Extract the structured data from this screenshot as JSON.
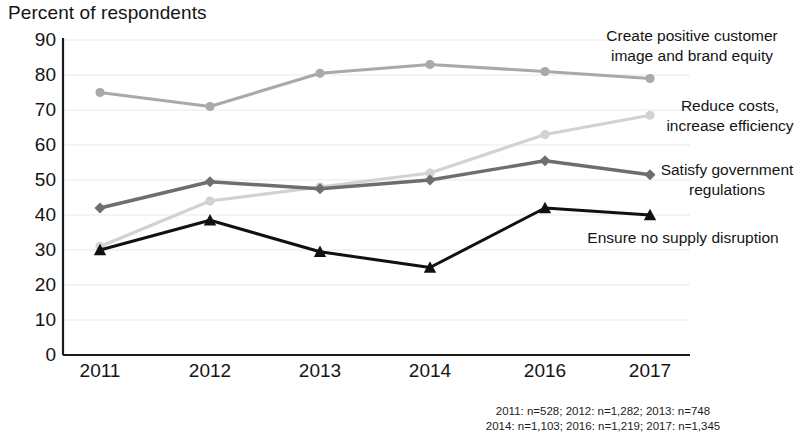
{
  "chart_data": {
    "type": "line",
    "title": "",
    "ylabel": "Percent of respondents",
    "xlabel": "",
    "categories": [
      "2011",
      "2012",
      "2013",
      "2014",
      "2016",
      "2017"
    ],
    "ylim": [
      0,
      90
    ],
    "ytick_labels": [
      "0",
      "10",
      "20",
      "30",
      "40",
      "50",
      "60",
      "70",
      "80",
      "90"
    ],
    "ytick_values": [
      0,
      10,
      20,
      30,
      40,
      50,
      60,
      70,
      80,
      90
    ],
    "grid": true,
    "legend_position": "inline-right",
    "series": [
      {
        "name": "Create positive customer image and brand equity",
        "label_line1": "Create positive customer",
        "label_line2": "image and brand equity",
        "color": "#a9a9a9",
        "marker": "circle",
        "values": [
          75,
          71,
          80.5,
          83,
          81,
          79
        ]
      },
      {
        "name": "Reduce costs, increase efficiency",
        "label_line1": "Reduce costs,",
        "label_line2": "increase efficiency",
        "color": "#d2d2d2",
        "marker": "circle",
        "values": [
          31,
          44,
          48,
          52,
          63,
          68.5
        ]
      },
      {
        "name": "Satisfy government regulations",
        "label_line1": "Satisfy government",
        "label_line2": "regulations",
        "color": "#6e6e6e",
        "marker": "diamond",
        "values": [
          42,
          49.5,
          47.5,
          50,
          55.5,
          51.5
        ]
      },
      {
        "name": "Ensure no supply disruption",
        "label_line1": "Ensure no supply disruption",
        "label_line2": "",
        "color": "#111111",
        "marker": "triangle",
        "values": [
          30,
          38.5,
          29.5,
          25,
          42,
          40
        ]
      }
    ],
    "annotations": [
      "2011: n=528; 2012: n=1,282; 2013: n=748"
    ]
  },
  "footnote": {
    "line1": "2011: n=528; 2012: n=1,282; 2013: n=748",
    "line2": "2014: n=1,103; 2016: n=1,219; 2017: n=1,345"
  }
}
